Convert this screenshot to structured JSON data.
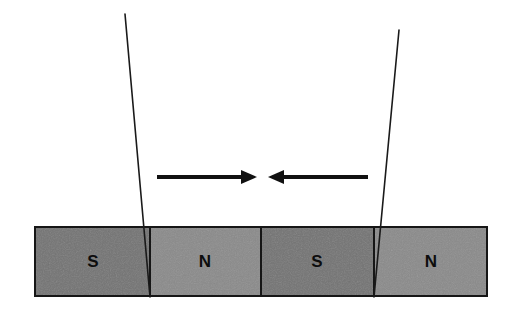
{
  "figure": {
    "background_color": "#ffffff",
    "width": 519,
    "height": 317
  },
  "magnet_bar": {
    "outline_color": "#161616",
    "outline_width": 2,
    "x": 34,
    "y": 226,
    "width": 454,
    "height": 71,
    "segments": [
      {
        "label": "S",
        "polarity": "south",
        "fill": "#737373",
        "x": 34,
        "width": 116,
        "label_x": 93,
        "label_y": 263
      },
      {
        "label": "N",
        "polarity": "north",
        "fill": "#8a8a8a",
        "x": 150,
        "width": 111,
        "label_x": 205,
        "label_y": 263
      },
      {
        "label": "S",
        "polarity": "south",
        "fill": "#737373",
        "x": 261,
        "width": 113,
        "label_x": 317,
        "label_y": 263
      },
      {
        "label": "N",
        "polarity": "north",
        "fill": "#8a8a8a",
        "x": 374,
        "width": 114,
        "label_x": 431,
        "label_y": 263
      }
    ],
    "divider_positions": [
      150,
      261,
      374
    ],
    "divider_color": "#161616"
  },
  "domain_walls": [
    {
      "name": "left-domain-wall",
      "x1": 125,
      "y1": 14,
      "x2": 150,
      "y2": 297,
      "color": "#1a1a1a",
      "width": 1.6
    },
    {
      "name": "right-domain-wall",
      "x1": 399,
      "y1": 30,
      "x2": 374,
      "y2": 297,
      "color": "#1a1a1a",
      "width": 1.6
    }
  ],
  "arrows": [
    {
      "name": "left-arrow-pointing-right",
      "direction": "right",
      "tail_x": 157,
      "tip_x": 257,
      "y": 177,
      "shaft_thickness": 4,
      "head_length": 16,
      "head_half_height": 7,
      "color": "#111111"
    },
    {
      "name": "right-arrow-pointing-left",
      "direction": "left",
      "tail_x": 368,
      "tip_x": 268,
      "y": 177,
      "shaft_thickness": 4,
      "head_length": 16,
      "head_half_height": 7,
      "color": "#111111"
    }
  ],
  "colors": {
    "south_fill": "#737373",
    "north_fill": "#8a8a8a",
    "stroke": "#161616",
    "label_text": "#0d0d0d",
    "background": "#ffffff"
  }
}
